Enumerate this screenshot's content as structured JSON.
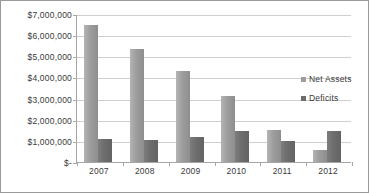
{
  "chart_data": {
    "type": "bar",
    "title": "",
    "xlabel": "",
    "ylabel": "",
    "categories": [
      "2007",
      "2008",
      "2009",
      "2010",
      "2011",
      "2012"
    ],
    "ylim": [
      0,
      7000000
    ],
    "ytick_values": [
      0,
      1000000,
      2000000,
      3000000,
      4000000,
      5000000,
      6000000,
      7000000
    ],
    "ytick_labels": [
      "$-",
      "$1,000,000",
      "$2,000,000",
      "$3,000,000",
      "$4,000,000",
      "$5,000,000",
      "$6,000,000",
      "$7,000,000"
    ],
    "grid": true,
    "legend_position": "right",
    "series": [
      {
        "name": "Net Assets",
        "color": "#9d9d9d",
        "values": [
          6500000,
          5350000,
          4300000,
          3100000,
          1500000,
          550000
        ]
      },
      {
        "name": "Deficits",
        "color": "#6d6d6d",
        "values": [
          1080000,
          1020000,
          1180000,
          1450000,
          1000000,
          1450000
        ]
      }
    ]
  },
  "legend": {
    "items": [
      {
        "label": "Net Assets"
      },
      {
        "label": "Deficits"
      }
    ]
  }
}
